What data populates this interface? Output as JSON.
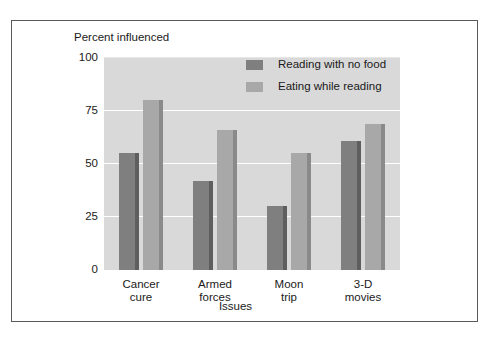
{
  "chart_data": {
    "type": "bar",
    "title": "",
    "ylabel": "Percent influenced",
    "xlabel": "Issues",
    "categories": [
      "Cancer\ncure",
      "Armed\nforces",
      "Moon\ntrip",
      "3-D\nmovies"
    ],
    "category_lines": [
      [
        "Cancer",
        "cure"
      ],
      [
        "Armed",
        "forces"
      ],
      [
        "Moon",
        "trip"
      ],
      [
        "3-D",
        "movies"
      ]
    ],
    "series": [
      {
        "name": "Reading with no food",
        "color": "#7f7f7f",
        "side_color": "#5e5e5e",
        "values": [
          55,
          42,
          30,
          61
        ]
      },
      {
        "name": "Eating while reading",
        "color": "#a8a8a8",
        "side_color": "#8a8a8a",
        "values": [
          80,
          66,
          55,
          69
        ]
      }
    ],
    "ylim": [
      0,
      100
    ],
    "yticks": [
      0,
      25,
      50,
      75,
      100
    ],
    "ytick_labels": [
      "0",
      "25",
      "50",
      "75",
      "100"
    ],
    "grid": true,
    "grid_color": "#ffffff",
    "plot_background": "#d9d9d9",
    "legend_position": "top-right-inside"
  }
}
